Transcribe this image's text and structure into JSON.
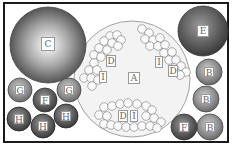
{
  "diagram": {
    "frame": {
      "border_color": "#1a1a1a",
      "background": "#ffffff"
    },
    "big_circles": [
      {
        "id": "A",
        "label": "A",
        "cx": 114,
        "cy": 76,
        "r": 60,
        "fill": "#f2f2f2",
        "stroke": "#777777"
      },
      {
        "id": "C",
        "label": "C",
        "cx": 48,
        "cy": 44,
        "r": 38,
        "fill": "gradient-radial-gray",
        "stroke": "#555555"
      },
      {
        "id": "E",
        "label": "E",
        "cx": 203,
        "cy": 32,
        "r": 25,
        "fill": "#7a7a7a",
        "stroke": "#444444"
      }
    ],
    "small_circles": [
      {
        "label": "G",
        "cx": 20,
        "cy": 90,
        "r": 12,
        "fill": "#9a9a9a"
      },
      {
        "label": "F",
        "cx": 45,
        "cy": 100,
        "r": 12,
        "fill": "#6e6e6e"
      },
      {
        "label": "G",
        "cx": 69,
        "cy": 90,
        "r": 12,
        "fill": "#9a9a9a"
      },
      {
        "label": "H",
        "cx": 19,
        "cy": 119,
        "r": 12,
        "fill": "#555555"
      },
      {
        "label": "H",
        "cx": 43,
        "cy": 126,
        "r": 12,
        "fill": "#555555"
      },
      {
        "label": "H",
        "cx": 66,
        "cy": 116,
        "r": 12,
        "fill": "#555555"
      },
      {
        "label": "B",
        "cx": 209,
        "cy": 72,
        "r": 13,
        "fill": "#8a8a8a"
      },
      {
        "label": "B",
        "cx": 206,
        "cy": 99,
        "r": 13,
        "fill": "#8a8a8a"
      },
      {
        "label": "B",
        "cx": 210,
        "cy": 127,
        "r": 13,
        "fill": "#8a8a8a"
      },
      {
        "label": "F",
        "cx": 184,
        "cy": 126,
        "r": 13,
        "fill": "#6e6e6e"
      }
    ],
    "clusters": [
      {
        "name": "upper-left",
        "labels": [
          {
            "text": "D",
            "x": 108,
            "y": 55
          },
          {
            "text": "I",
            "x": 100,
            "y": 72
          }
        ]
      },
      {
        "name": "upper-right",
        "labels": [
          {
            "text": "I",
            "x": 157,
            "y": 55
          },
          {
            "text": "D",
            "x": 170,
            "y": 67
          }
        ]
      },
      {
        "name": "bottom",
        "labels": [
          {
            "text": "D",
            "x": 119,
            "y": 112
          },
          {
            "text": "I",
            "x": 133,
            "y": 112
          }
        ]
      }
    ],
    "center_label": {
      "text": "A",
      "x": 130,
      "y": 72
    }
  }
}
